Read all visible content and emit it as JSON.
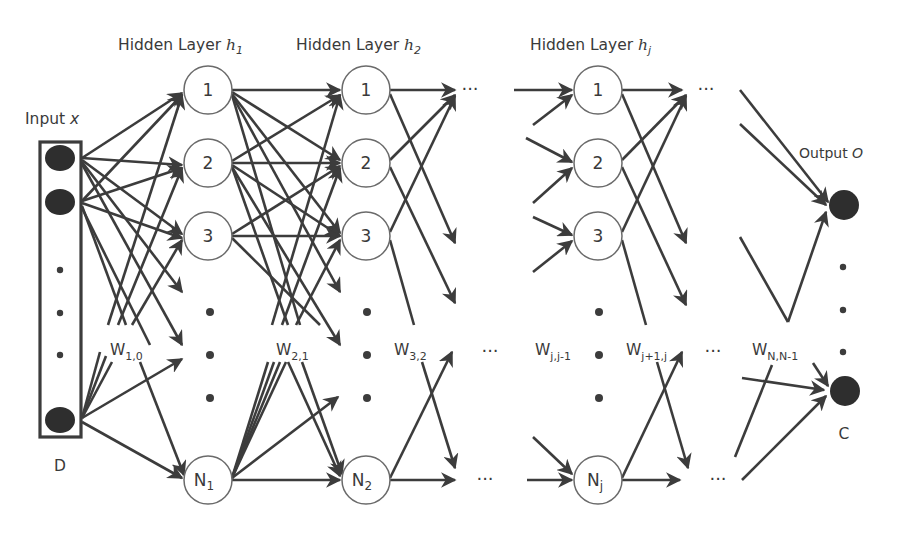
{
  "colors": {
    "background": "#ffffff",
    "line": "#3c3c3c",
    "node_fill": "#ffffff",
    "node_stroke": "#6a6a6a",
    "input_output_fill": "#2e2e2e",
    "text": "#3a3a3a"
  },
  "labels": {
    "input": {
      "text": "Input ",
      "var": "x"
    },
    "output": {
      "text": "Output ",
      "var": "O"
    },
    "input_dim": "D",
    "output_dim": "C",
    "hidden1": {
      "text": "Hidden Layer ",
      "var": "h",
      "sub": "1"
    },
    "hidden2": {
      "text": "Hidden Layer ",
      "var": "h",
      "sub": "2"
    },
    "hiddenj": {
      "text": "Hidden Layer ",
      "var": "h",
      "sub": "j"
    }
  },
  "layers": {
    "hidden1": {
      "nodes": [
        "1",
        "2",
        "3"
      ],
      "last": {
        "base": "N",
        "sub": "1"
      }
    },
    "hidden2": {
      "nodes": [
        "1",
        "2",
        "3"
      ],
      "last": {
        "base": "N",
        "sub": "2"
      }
    },
    "hiddenj": {
      "nodes": [
        "1",
        "2",
        "3"
      ],
      "last": {
        "base": "N",
        "sub": "j"
      }
    }
  },
  "weights": [
    {
      "base": "W",
      "sub": "1,0"
    },
    {
      "base": "W",
      "sub": "2,1"
    },
    {
      "base": "W",
      "sub": "3,2"
    },
    {
      "base": "W",
      "sub": "j,j-1"
    },
    {
      "base": "W",
      "sub": "j+1,j"
    },
    {
      "base": "W",
      "sub": "N,N-1"
    }
  ],
  "ellipsis": "···"
}
